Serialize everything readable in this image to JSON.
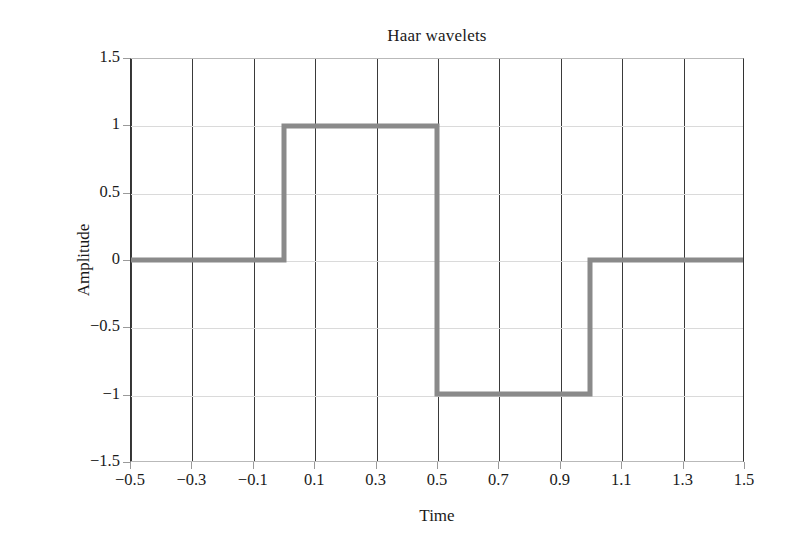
{
  "figure": {
    "title": "Haar wavelets",
    "background_color": "#ffffff"
  },
  "axes": {
    "x": {
      "label": "Time",
      "ticks": [
        "−0.5",
        "−0.3",
        "−0.1",
        "0.1",
        "0.3",
        "0.5",
        "0.7",
        "0.9",
        "1.1",
        "1.3",
        "1.5"
      ],
      "tick_values": [
        -0.5,
        -0.3,
        -0.1,
        0.1,
        0.3,
        0.5,
        0.7,
        0.9,
        1.1,
        1.3,
        1.5
      ],
      "min": -0.5,
      "max": 1.5,
      "gridline_color": "#3a3a3a"
    },
    "y": {
      "label": "Amplitude",
      "ticks": [
        "1.5",
        "1",
        "0.5",
        "0",
        "−0.5",
        "−1",
        "−1.5"
      ],
      "tick_values": [
        1.5,
        1,
        0.5,
        0,
        -0.5,
        -1,
        -1.5
      ],
      "min": -1.5,
      "max": 1.5,
      "gridline_color": "#dadada"
    }
  },
  "series_style": {
    "line_color": "#8a8a8a",
    "line_width": 5
  },
  "chart_data": {
    "type": "line",
    "title": "Haar wavelets",
    "xlabel": "Time",
    "ylabel": "Amplitude",
    "xlim": [
      -0.5,
      1.5
    ],
    "ylim": [
      -1.5,
      1.5
    ],
    "grid": true,
    "legend": "none",
    "xticks": [
      -0.5,
      -0.3,
      -0.1,
      0.1,
      0.3,
      0.5,
      0.7,
      0.9,
      1.1,
      1.3,
      1.5
    ],
    "yticks": [
      -1.5,
      -1,
      -0.5,
      0,
      0.5,
      1,
      1.5
    ],
    "series": [
      {
        "name": "Haar wavelet",
        "color": "#8a8a8a",
        "drawstyle": "steps",
        "x": [
          -0.5,
          0.0,
          0.0,
          0.5,
          0.5,
          1.0,
          1.0,
          1.5
        ],
        "y": [
          0,
          0,
          1,
          1,
          -1,
          -1,
          0,
          0
        ]
      }
    ],
    "segments": [
      {
        "x_start": -0.5,
        "x_end": 0.0,
        "value": 0
      },
      {
        "x_start": 0.0,
        "x_end": 0.5,
        "value": 1
      },
      {
        "x_start": 0.5,
        "x_end": 1.0,
        "value": -1
      },
      {
        "x_start": 1.0,
        "x_end": 1.5,
        "value": 0
      }
    ]
  }
}
